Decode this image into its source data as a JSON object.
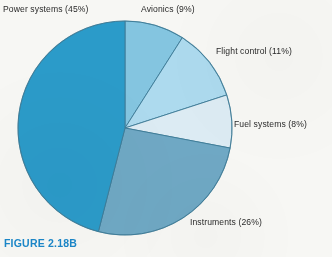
{
  "figure": {
    "caption": "FIGURE 2.18B",
    "caption_color": "#1b87c9",
    "background_color": "#f7f7f4"
  },
  "labels": {
    "power": "Power systems (45%)",
    "avionics": "Avionics (9%)",
    "flight_control": "Flight control (11%)",
    "fuel_systems": "Fuel systems (8%)",
    "instruments": "Instruments (26%)"
  },
  "chart_data": {
    "type": "pie",
    "title": "FIGURE 2.18B",
    "xlabel": "",
    "ylabel": "",
    "grid": false,
    "legend_position": "callout-labels",
    "start_angle_deg": 0,
    "direction": "clockwise",
    "center_px": [
      125,
      128
    ],
    "radius_px": 107,
    "categories": [
      "Avionics",
      "Flight control",
      "Fuel systems",
      "Instruments",
      "Power systems"
    ],
    "values": [
      9,
      11,
      8,
      26,
      45
    ],
    "value_unit": "%",
    "slices": [
      {
        "label": "Avionics (9%)",
        "name": "Avionics",
        "value": 9,
        "color": "#84c5e0",
        "start_deg": 0,
        "end_deg": 32.4,
        "label_position": "top-right"
      },
      {
        "label": "Flight control (11%)",
        "name": "Flight control",
        "value": 11,
        "color": "#addaee",
        "start_deg": 32.4,
        "end_deg": 72.0,
        "label_position": "right-upper"
      },
      {
        "label": "Fuel systems (8%)",
        "name": "Fuel systems",
        "value": 8,
        "color": "#dcebf3",
        "start_deg": 72.0,
        "end_deg": 100.8,
        "label_position": "right"
      },
      {
        "label": "Instruments (26%)",
        "name": "Instruments",
        "value": 26,
        "color": "#6fa8c4",
        "start_deg": 100.8,
        "end_deg": 194.4,
        "label_position": "bottom-right"
      },
      {
        "label": "Power systems (45%)",
        "name": "Power systems",
        "value": 45,
        "color": "#2b9bc9",
        "start_deg": 194.4,
        "end_deg": 360.0,
        "label_position": "top-left"
      }
    ],
    "slice_outline_color": "#3c7a96",
    "total": 99
  }
}
